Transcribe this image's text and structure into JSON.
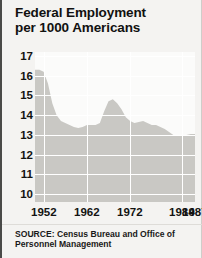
{
  "title": {
    "line1": "Federal Employment",
    "line2": "per 1000 Americans"
  },
  "source": {
    "line1": "SOURCE: Census Bureau and Office of",
    "line2": "Personnel Management"
  },
  "colors": {
    "background": "#f4f3f1",
    "plot_background": "#fbfbfa",
    "area_fill": "#c9c8c4",
    "gridline": "#ffffff",
    "text": "#131312",
    "border": "#4a4a48"
  },
  "chart_data": {
    "type": "area",
    "title": "Federal Employment per 1000 Americans",
    "xlabel": "",
    "ylabel": "Federal Employment per 1000 Americans",
    "xlim": [
      1950,
      1987
    ],
    "ylim": [
      9.6,
      17.2
    ],
    "grid": true,
    "legend": null,
    "ytick_labels": [
      "17",
      "16",
      "15",
      "14",
      "13",
      "12",
      "11",
      "10"
    ],
    "ytick_values": [
      17,
      16,
      15,
      14,
      13,
      12,
      11,
      10
    ],
    "xtick_labels": [
      "1952",
      "1962",
      "1972",
      "1984",
      "1987"
    ],
    "xtick_values": [
      1952,
      1962,
      1972,
      1984,
      1987
    ],
    "x": [
      1950,
      1951,
      1952,
      1953,
      1954,
      1955,
      1956,
      1957,
      1958,
      1959,
      1960,
      1961,
      1962,
      1963,
      1964,
      1965,
      1966,
      1967,
      1968,
      1969,
      1970,
      1971,
      1972,
      1973,
      1974,
      1975,
      1976,
      1977,
      1978,
      1979,
      1980,
      1981,
      1982,
      1983,
      1984,
      1985,
      1986,
      1987
    ],
    "values": [
      16.3,
      16.3,
      16.2,
      15.6,
      14.6,
      14.0,
      13.7,
      13.6,
      13.5,
      13.4,
      13.35,
      13.4,
      13.5,
      13.5,
      13.5,
      13.6,
      14.2,
      14.7,
      14.8,
      14.6,
      14.3,
      13.9,
      13.7,
      13.6,
      13.65,
      13.7,
      13.6,
      13.5,
      13.5,
      13.4,
      13.3,
      13.15,
      13.0,
      13.0,
      13.0,
      13.0,
      13.05,
      13.05
    ]
  }
}
